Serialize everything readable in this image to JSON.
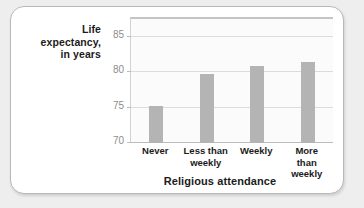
{
  "chart_data": {
    "type": "bar",
    "title": "",
    "subtitle": "",
    "xlabel": "Religious attendance",
    "ylabel": "Life expectancy, in years",
    "ylabel_lines": [
      "Life",
      "expectancy,",
      "in years"
    ],
    "categories": [
      "Never",
      "Less than weekly",
      "Weekly",
      "More than weekly"
    ],
    "category_lines": [
      [
        "Never"
      ],
      [
        "Less than",
        "weekly"
      ],
      [
        "Weekly"
      ],
      [
        "More than",
        "weekly"
      ]
    ],
    "values": [
      75.2,
      79.7,
      80.9,
      81.4
    ],
    "ylim": [
      70,
      87.5
    ],
    "yticks": [
      70,
      75,
      80,
      85
    ],
    "ytick_labels": [
      "70",
      "75",
      "80",
      "85"
    ],
    "grid": true,
    "grid_axis": "y",
    "legend": false,
    "legend_position": "none",
    "bar_color": "#b4b4b4",
    "plot_background": "#fbfbfb",
    "gridline_color": "#dcdcdc",
    "card_background": "#ffffff",
    "page_background": "#eeeeee",
    "tick_label_color": "#8d8d8d",
    "axis_title_color": "#1b1b1b"
  }
}
